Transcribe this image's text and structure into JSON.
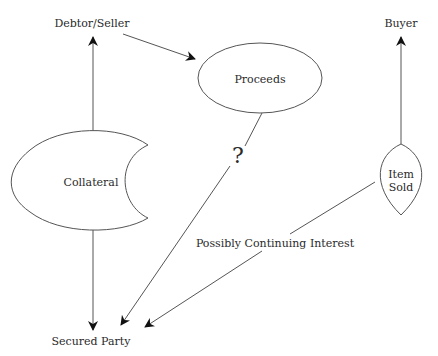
{
  "diagram": {
    "colors": {
      "stroke": "#555555",
      "arrow": "#111111",
      "text": "#2a2a2a",
      "background": "#ffffff"
    },
    "nodes": {
      "debtor_seller": "Debtor/Seller",
      "buyer": "Buyer",
      "proceeds": "Proceeds",
      "collateral": "Collateral",
      "item_sold_line1": "Item",
      "item_sold_line2": "Sold",
      "secured_party": "Secured Party"
    },
    "edge_labels": {
      "question": "?",
      "possibly_continuing_interest": "Possibly Continuing Interest"
    },
    "edges": [
      {
        "from": "Collateral",
        "to": "Debtor/Seller"
      },
      {
        "from": "Debtor/Seller",
        "to": "Proceeds"
      },
      {
        "from": "Item Sold",
        "to": "Buyer"
      },
      {
        "from": "Collateral",
        "to": "Secured Party"
      },
      {
        "from": "Proceeds",
        "to": "Secured Party",
        "label": "?"
      },
      {
        "from": "Item Sold",
        "to": "Secured Party",
        "label": "Possibly Continuing Interest"
      }
    ]
  }
}
